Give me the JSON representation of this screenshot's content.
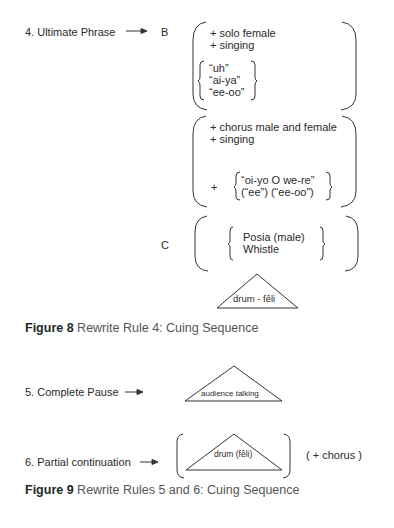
{
  "rule4": {
    "label": "4. Ultimate Phrase",
    "arrow": "arrow-right-icon",
    "b_label": "B",
    "c_label": "C",
    "b_group1": {
      "lines": [
        "+ solo female",
        "+ singing"
      ],
      "vocables": [
        "“uh”",
        "“ai-ya”",
        "“ee-oo”"
      ]
    },
    "b_group2": {
      "lines": [
        "+ chorus male and female",
        "+ singing"
      ],
      "plus": "+",
      "vocables": [
        "“oi-yo O we-re”",
        "(“ee”) (“ee-oo”)"
      ]
    },
    "c_group": {
      "options": [
        "Posia (male)",
        "Whistle"
      ]
    },
    "drum_label": "drum - fêli"
  },
  "figure8": {
    "number": "Figure 8",
    "caption": "Rewrite Rule 4: Cuing Sequence"
  },
  "rule5": {
    "label": "5. Complete Pause",
    "triangle_label": "audience talking"
  },
  "rule6": {
    "label": "6. Partial continuation",
    "triangle_label": "drum (fêli)",
    "optional": "( + chorus )"
  },
  "figure9": {
    "number": "Figure 9",
    "caption": "Rewrite Rules 5 and 6: Cuing Sequence"
  },
  "colors": {
    "ink": "#2a2a2a",
    "caption_text": "#555555",
    "caption_label": "#1c2a22"
  }
}
